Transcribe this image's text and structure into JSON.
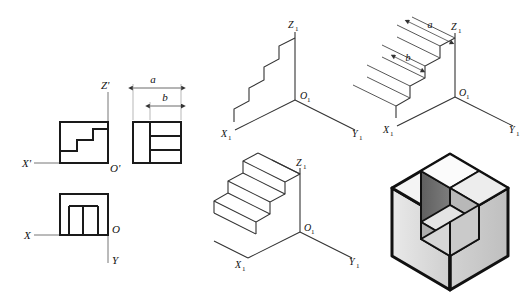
{
  "figure": {
    "background_color": "#ffffff",
    "line_color": "#1a1a1a",
    "thin_line_color": "#555555"
  },
  "orthographic": {
    "name": "three-view orthographic projection",
    "front_view": {
      "name": "front-view",
      "axis_labels": {
        "horizontal": "X'",
        "vertical": "Z'",
        "origin": "O'"
      },
      "outline": "square with three-step staircase profile cut from lower-left"
    },
    "side_view": {
      "name": "side-view",
      "outline": "square with horizontal bands and vertical division",
      "dimensions": [
        {
          "label": "a",
          "meaning": "overall width"
        },
        {
          "label": "b",
          "meaning": "step depth"
        }
      ]
    },
    "top_view": {
      "name": "top-view",
      "axis_labels": {
        "horizontal": "X",
        "vertical": "Y",
        "origin": "O"
      },
      "outline": "square with two vertical interior division lines"
    }
  },
  "isometric_steps": [
    {
      "id": "step-1",
      "name": "isometric-step-1-profile",
      "caption": "staircase profile on X1-Z1 plane",
      "axis_labels": {
        "x": "X",
        "y": "Y",
        "z": "Z",
        "origin": "O",
        "subscript": "1"
      }
    },
    {
      "id": "step-2",
      "name": "isometric-step-2-projection",
      "caption": "parallel depth projection lines",
      "axis_labels": {
        "x": "X",
        "y": "Y",
        "z": "Z",
        "origin": "O",
        "subscript": "1"
      },
      "dimensions": [
        {
          "label": "a"
        },
        {
          "label": "b"
        }
      ]
    },
    {
      "id": "step-3",
      "name": "isometric-step-3-solid",
      "caption": "completed wireframe solid",
      "axis_labels": {
        "x": "X",
        "y": "Y",
        "z": "Z",
        "origin": "O",
        "subscript": "1"
      }
    },
    {
      "id": "step-4",
      "name": "isometric-step-4-shaded",
      "caption": "final shaded hexagonal block with staircase recess",
      "shading": {
        "top_face": "#f2f2f2",
        "left_face": "#dcdcdc",
        "right_face": "#c9c9c9",
        "recess_dark": "#6e6e6e",
        "tread_light": "#ededed",
        "riser_mid": "#b5b5b5"
      }
    }
  ],
  "axis_label_text": {
    "x_prime": "X'",
    "z_prime": "Z'",
    "o_prime": "O'",
    "x": "X",
    "y": "Y",
    "o": "O",
    "x1_base": "X",
    "y1_base": "Y",
    "z1_base": "Z",
    "o1_base": "O",
    "sub_one": "1",
    "dim_a": "a",
    "dim_b": "b"
  }
}
